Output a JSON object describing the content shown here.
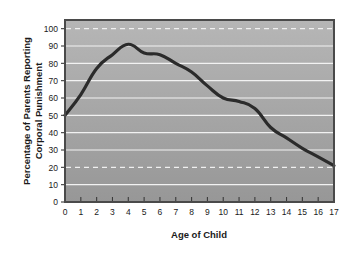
{
  "chart_data": {
    "type": "line",
    "title": "",
    "xlabel": "Age of Child",
    "ylabel": "Percentage of Parents Reporting Corporal Punishment",
    "ylabel_line1": "Percentage of Parents Reporting",
    "ylabel_line2": "Corporal Punishment",
    "x": [
      0,
      1,
      2,
      3,
      4,
      5,
      6,
      7,
      8,
      9,
      10,
      11,
      12,
      13,
      14,
      15,
      16,
      17
    ],
    "values": [
      50,
      62,
      77,
      85,
      91,
      86,
      85,
      80,
      75,
      67,
      60,
      58,
      54,
      43,
      37,
      31,
      26,
      21
    ],
    "xlim": [
      0,
      17
    ],
    "ylim": [
      0,
      105
    ],
    "xticks": [
      "0",
      "1",
      "2",
      "3",
      "4",
      "5",
      "6",
      "7",
      "8",
      "9",
      "10",
      "11",
      "12",
      "13",
      "14",
      "15",
      "16",
      "17"
    ],
    "yticks": [
      "0",
      "10",
      "20",
      "30",
      "40",
      "50",
      "60",
      "70",
      "80",
      "90",
      "100"
    ],
    "ytick_values": [
      0,
      10,
      20,
      30,
      40,
      50,
      60,
      70,
      80,
      90,
      100
    ],
    "dashed_gridlines": [
      20,
      100
    ],
    "grid": true,
    "legend": "none",
    "line_color": "#2b2b2b",
    "plot_background_top": "#b4b4b4",
    "plot_background_bottom": "#9a9a9a",
    "gridline_color": "#f2f2f2",
    "frame_color": "#4a4a4a",
    "page_background": "#ffffff"
  }
}
